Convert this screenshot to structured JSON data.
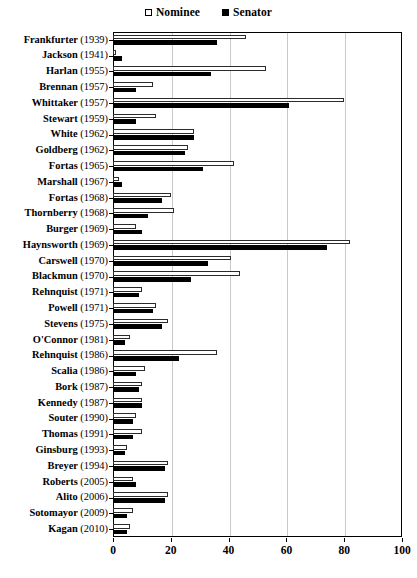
{
  "chart_data": {
    "type": "bar",
    "orientation": "horizontal",
    "title": "",
    "xlabel": "",
    "ylabel": "",
    "xlim": [
      0,
      100
    ],
    "xticks": [
      0,
      20,
      40,
      60,
      80,
      100
    ],
    "grid": "vertical",
    "legend_position": "top-center",
    "legend": [
      "Nominee",
      "Senator"
    ],
    "series": [
      {
        "name": "Nominee",
        "marker": "open-square",
        "color": "#ffffff",
        "values": [
          46,
          1,
          53,
          14,
          80,
          15,
          28,
          26,
          42,
          2,
          20,
          21,
          8,
          82,
          41,
          44,
          10,
          15,
          19,
          6,
          36,
          11,
          10,
          10,
          8,
          10,
          5,
          19,
          7,
          19,
          7,
          6
        ]
      },
      {
        "name": "Senator",
        "marker": "filled-square",
        "color": "#000000",
        "values": [
          36,
          3,
          34,
          8,
          61,
          8,
          28,
          25,
          31,
          3,
          17,
          12,
          10,
          74,
          33,
          27,
          9,
          14,
          17,
          4,
          23,
          8,
          9,
          10,
          7,
          7,
          4,
          18,
          8,
          18,
          5,
          5
        ]
      }
    ],
    "categories": [
      "Frankfurter (1939)",
      "Jackson (1941)",
      "Harlan (1955)",
      "Brennan (1957)",
      "Whittaker (1957)",
      "Stewart (1959)",
      "White (1962)",
      "Goldberg (1962)",
      "Fortas (1965)",
      "Marshall (1967)",
      "Fortas (1968)",
      "Thornberry (1968)",
      "Burger (1969)",
      "Haynsworth (1969)",
      "Carswell (1970)",
      "Blackmun (1970)",
      "Rehnquist (1971)",
      "Powell (1971)",
      "Stevens (1975)",
      "O'Connor (1981)",
      "Rehnquist (1986)",
      "Scalia (1986)",
      "Bork (1987)",
      "Kennedy (1987)",
      "Souter (1990)",
      "Thomas (1991)",
      "Ginsburg (1993)",
      "Breyer (1994)",
      "Roberts (2005)",
      "Alito (2006)",
      "Sotomayor (2009)",
      "Kagan (2010)"
    ]
  }
}
